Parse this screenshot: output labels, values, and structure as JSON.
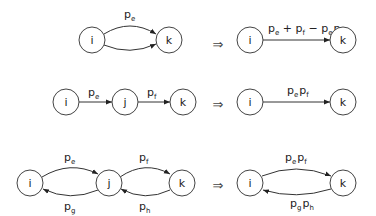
{
  "rules": [
    {
      "name": "parallel-edges",
      "before": {
        "nodes": [
          {
            "id": "i",
            "label": "i"
          },
          {
            "id": "k",
            "label": "k"
          }
        ],
        "edges": [
          {
            "from": "i",
            "to": "k",
            "label": "p_e"
          },
          {
            "from": "i",
            "to": "k",
            "label": ""
          }
        ]
      },
      "implies": "⇒",
      "after": {
        "nodes": [
          {
            "id": "i",
            "label": "i"
          },
          {
            "id": "k",
            "label": "k"
          }
        ],
        "edges": [
          {
            "from": "i",
            "to": "k",
            "label": "p_e + p_f − p_e p_f"
          }
        ]
      }
    },
    {
      "name": "series-edges",
      "before": {
        "nodes": [
          {
            "id": "i",
            "label": "i"
          },
          {
            "id": "j",
            "label": "j"
          },
          {
            "id": "k",
            "label": "k"
          }
        ],
        "edges": [
          {
            "from": "i",
            "to": "j",
            "label": "p_e"
          },
          {
            "from": "j",
            "to": "k",
            "label": "p_f"
          }
        ]
      },
      "implies": "⇒",
      "after": {
        "nodes": [
          {
            "id": "i",
            "label": "i"
          },
          {
            "id": "k",
            "label": "k"
          }
        ],
        "edges": [
          {
            "from": "i",
            "to": "k",
            "label": "p_e p_f"
          }
        ]
      }
    },
    {
      "name": "bidirectional-series",
      "before": {
        "nodes": [
          {
            "id": "i",
            "label": "i"
          },
          {
            "id": "j",
            "label": "j"
          },
          {
            "id": "k",
            "label": "k"
          }
        ],
        "edges": [
          {
            "from": "i",
            "to": "j",
            "label": "p_e"
          },
          {
            "from": "j",
            "to": "i",
            "label": "p_g"
          },
          {
            "from": "j",
            "to": "k",
            "label": "p_f"
          },
          {
            "from": "k",
            "to": "j",
            "label": "p_h"
          }
        ]
      },
      "implies": "⇒",
      "after": {
        "nodes": [
          {
            "id": "i",
            "label": "i"
          },
          {
            "id": "k",
            "label": "k"
          }
        ],
        "edges": [
          {
            "from": "i",
            "to": "k",
            "label": "p_e p_f"
          },
          {
            "from": "k",
            "to": "i",
            "label": "p_g p_h"
          }
        ]
      }
    }
  ],
  "text": {
    "implies": "⇒",
    "p": "p",
    "sub_e": "e",
    "sub_f": "f",
    "sub_g": "g",
    "sub_h": "h",
    "plus": " + ",
    "minus": " − ",
    "node_i": "i",
    "node_j": "j",
    "node_k": "k"
  }
}
